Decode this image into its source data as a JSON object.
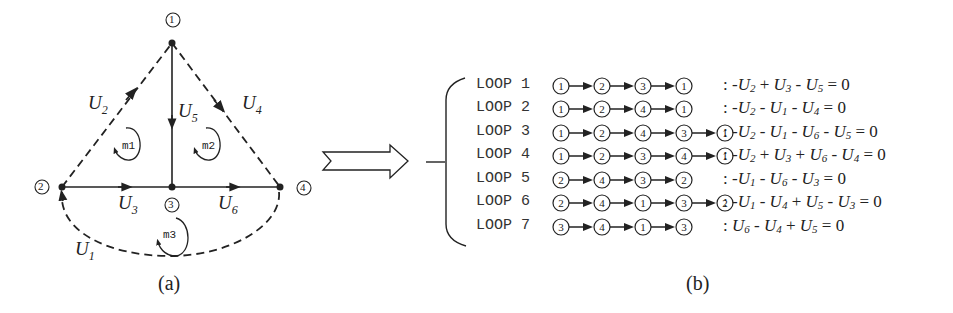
{
  "figure_a": {
    "caption": "(a)",
    "nodes": [
      {
        "id": "1",
        "label": "1",
        "x": 172,
        "y": 43
      },
      {
        "id": "2",
        "label": "2",
        "x": 62,
        "y": 187
      },
      {
        "id": "3",
        "label": "3",
        "x": 172,
        "y": 187
      },
      {
        "id": "4",
        "label": "4",
        "x": 280,
        "y": 187
      }
    ],
    "branches": [
      {
        "name": "U1",
        "base": "U",
        "sub": "1",
        "from": "4",
        "to": "2",
        "style": "dashed-arc"
      },
      {
        "name": "U2",
        "base": "U",
        "sub": "2",
        "from": "2",
        "to": "1",
        "style": "dashed"
      },
      {
        "name": "U3",
        "base": "U",
        "sub": "3",
        "from": "2",
        "to": "3",
        "style": "solid"
      },
      {
        "name": "U4",
        "base": "U",
        "sub": "4",
        "from": "1",
        "to": "4",
        "style": "dashed"
      },
      {
        "name": "U5",
        "base": "U",
        "sub": "5",
        "from": "1",
        "to": "3",
        "style": "solid"
      },
      {
        "name": "U6",
        "base": "U",
        "sub": "6",
        "from": "3",
        "to": "4",
        "style": "solid"
      }
    ],
    "meshes": [
      {
        "label": "m1"
      },
      {
        "label": "m2"
      },
      {
        "label": "m3"
      }
    ]
  },
  "figure_b": {
    "caption": "(b)",
    "loops": [
      {
        "label": "LOOP 1",
        "path": [
          "1",
          "2",
          "3",
          "1"
        ],
        "equation": ": -U2 + U3 - U5 = 0",
        "terms": [
          {
            "sign": "-",
            "v": "U",
            "s": "2"
          },
          {
            "sign": "+",
            "v": "U",
            "s": "3"
          },
          {
            "sign": "-",
            "v": "U",
            "s": "5"
          }
        ]
      },
      {
        "label": "LOOP 2",
        "path": [
          "1",
          "2",
          "4",
          "1"
        ],
        "equation": ": -U2 - U1 - U4 = 0",
        "terms": [
          {
            "sign": "-",
            "v": "U",
            "s": "2"
          },
          {
            "sign": "-",
            "v": "U",
            "s": "1"
          },
          {
            "sign": "-",
            "v": "U",
            "s": "4"
          }
        ]
      },
      {
        "label": "LOOP 3",
        "path": [
          "1",
          "2",
          "4",
          "3",
          "1"
        ],
        "equation": ": -U2 - U1 - U6 - U5 = 0",
        "terms": [
          {
            "sign": "-",
            "v": "U",
            "s": "2"
          },
          {
            "sign": "-",
            "v": "U",
            "s": "1"
          },
          {
            "sign": "-",
            "v": "U",
            "s": "6"
          },
          {
            "sign": "-",
            "v": "U",
            "s": "5"
          }
        ]
      },
      {
        "label": "LOOP 4",
        "path": [
          "1",
          "2",
          "3",
          "4",
          "1"
        ],
        "equation": ": -U2 + U3 + U6 - U4 = 0",
        "terms": [
          {
            "sign": "-",
            "v": "U",
            "s": "2"
          },
          {
            "sign": "+",
            "v": "U",
            "s": "3"
          },
          {
            "sign": "+",
            "v": "U",
            "s": "6"
          },
          {
            "sign": "-",
            "v": "U",
            "s": "4"
          }
        ]
      },
      {
        "label": "LOOP 5",
        "path": [
          "2",
          "4",
          "3",
          "2"
        ],
        "equation": ": -U1 - U6 - U3 = 0",
        "terms": [
          {
            "sign": "-",
            "v": "U",
            "s": "1"
          },
          {
            "sign": "-",
            "v": "U",
            "s": "6"
          },
          {
            "sign": "-",
            "v": "U",
            "s": "3"
          }
        ]
      },
      {
        "label": "LOOP 6",
        "path": [
          "2",
          "4",
          "1",
          "3",
          "2"
        ],
        "equation": ": -U1 - U4 + U5 - U3 = 0",
        "terms": [
          {
            "sign": "-",
            "v": "U",
            "s": "1"
          },
          {
            "sign": "-",
            "v": "U",
            "s": "4"
          },
          {
            "sign": "+",
            "v": "U",
            "s": "5"
          },
          {
            "sign": "-",
            "v": "U",
            "s": "3"
          }
        ]
      },
      {
        "label": "LOOP 7",
        "path": [
          "3",
          "4",
          "1",
          "3"
        ],
        "equation": ": U6 - U4 + U5 = 0",
        "terms": [
          {
            "sign": "",
            "v": "U",
            "s": "6"
          },
          {
            "sign": "-",
            "v": "U",
            "s": "4"
          },
          {
            "sign": "+",
            "v": "U",
            "s": "5"
          }
        ]
      }
    ]
  },
  "transform_arrow": {
    "icon": "double-outline-arrow-right-icon"
  },
  "colors": {
    "stroke": "#222222",
    "background": "#ffffff"
  }
}
